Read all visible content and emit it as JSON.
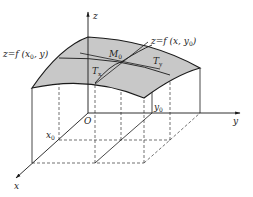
{
  "figure": {
    "type": "3d-surface-partial-derivative-illustration",
    "colors": {
      "surface_fill": "#c8c8c8",
      "line": "#1a1a1a",
      "dashed": "#333333",
      "background": "#ffffff"
    },
    "axes": {
      "x_label": "x",
      "y_label": "y",
      "z_label": "z",
      "origin_label": "O"
    },
    "labels": {
      "curve_x0": {
        "prefix": "z=f (x",
        "sub": "0",
        "suffix": ", y)"
      },
      "curve_y0": {
        "prefix": "z=f (x, y",
        "sub": "0",
        "suffix": ")"
      },
      "point": {
        "main": "M",
        "sub": "0"
      },
      "tangent_x": {
        "main": "T",
        "sub": "x"
      },
      "tangent_y": {
        "main": "T",
        "sub": "y"
      },
      "x0": {
        "main": "x",
        "sub": "0"
      },
      "y0": {
        "main": "y",
        "sub": "0"
      }
    }
  }
}
